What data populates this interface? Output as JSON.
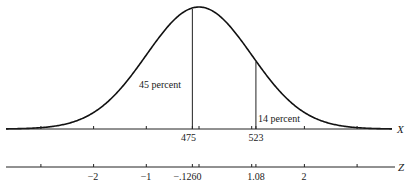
{
  "chart_data": {
    "type": "line",
    "title": "",
    "curve": {
      "distribution": "normal",
      "mean_z": 0,
      "sd_z": 1
    },
    "x_axis": {
      "label": "X",
      "marked_values": [
        {
          "label": "475",
          "z": -0.126
        },
        {
          "label": "523",
          "z": 1.08
        }
      ],
      "tick_z": [
        -3,
        -2,
        -1,
        -0.126,
        0,
        1,
        1.08,
        2,
        3
      ]
    },
    "z_axis": {
      "label": "Z",
      "tick_labels": [
        {
          "label": "−2",
          "z": -2
        },
        {
          "label": "−1",
          "z": -1
        },
        {
          "label": "−.126",
          "z": -0.126
        },
        {
          "label": "0",
          "z": 0
        },
        {
          "label": "1.08",
          "z": 1.08
        },
        {
          "label": "2",
          "z": 2
        }
      ],
      "tick_z": [
        -3,
        -2,
        -1,
        -0.126,
        0,
        1,
        1.08,
        2,
        3
      ]
    },
    "annotations": [
      {
        "text": "45 percent",
        "region": "between z=-0.126 and left tail (area left of 475)"
      },
      {
        "text": "14 percent",
        "region": "right tail beyond z=1.08 (X > 523)"
      }
    ],
    "vertical_lines_z": [
      -0.126,
      1.08
    ],
    "grid": false,
    "legend": null
  },
  "labels": {
    "pct_left": "45 percent",
    "pct_right": "14 percent",
    "x_475": "475",
    "x_523": "523",
    "x_axis_name": "X",
    "z_axis_name": "Z",
    "z_m2": "−2",
    "z_m1": "−1",
    "z_m0126": "−.126",
    "z_0": "0",
    "z_108": "1.08",
    "z_2": "2"
  }
}
